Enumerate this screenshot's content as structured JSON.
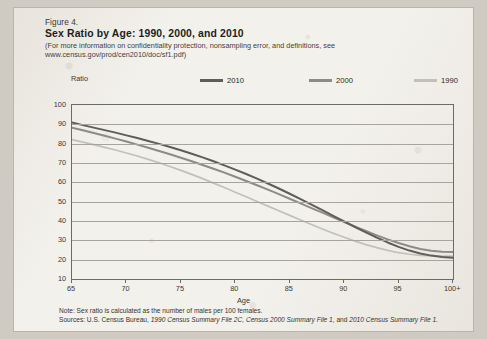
{
  "figure": {
    "number": "Figure 4.",
    "title": "Sex Ratio by Age: 1990, 2000, and 2010",
    "subtitle_line1": "(For more information on confidentiality protection, nonsampling error, and definitions, see",
    "subtitle_line2": "www.census.gov/prod/cen2010/doc/sf1.pdf)"
  },
  "notes": {
    "note": "Note: Sex ratio is calculated as the number of males per 100 females.",
    "sources_prefix": "Sources: U.S. Census Bureau, ",
    "sources_italic1": "1990 Census Summary File 2C, Census 2000 Summary File 1,",
    "sources_mid": " and ",
    "sources_italic2": "2010 Census Summary File 1."
  },
  "colors": {
    "series_2010": "#5f5d5a",
    "series_2000": "#8d8b88",
    "series_1990": "#c2c0bd",
    "axis": "#6d6a64",
    "grid": "#a8a49c",
    "text": "#2e2c28"
  },
  "chart_data": {
    "type": "line",
    "title": "Sex Ratio by Age: 1990, 2000, and 2010",
    "xlabel": "Age",
    "ylabel": "Ratio",
    "xlim": [
      65,
      100
    ],
    "ylim": [
      10,
      100
    ],
    "ytick_labels": [
      "100",
      "90",
      "80",
      "70",
      "60",
      "50",
      "40",
      "30",
      "20",
      "10"
    ],
    "ytick_values": [
      100,
      90,
      80,
      70,
      60,
      50,
      40,
      30,
      20,
      10
    ],
    "xtick_labels": [
      "65",
      "70",
      "75",
      "80",
      "85",
      "90",
      "95",
      "100+"
    ],
    "xtick_values": [
      65,
      70,
      75,
      80,
      85,
      90,
      95,
      100
    ],
    "grid": true,
    "legend_position": "top",
    "x": [
      65,
      66,
      67,
      68,
      69,
      70,
      71,
      72,
      73,
      74,
      75,
      76,
      77,
      78,
      79,
      80,
      81,
      82,
      83,
      84,
      85,
      86,
      87,
      88,
      89,
      90,
      91,
      92,
      93,
      94,
      95,
      96,
      97,
      98,
      99,
      100
    ],
    "series": [
      {
        "name": "2010",
        "color": "#5f5d5a",
        "values": [
          90.9,
          89.6,
          88.3,
          87.0,
          85.7,
          84.3,
          82.9,
          81.4,
          79.9,
          78.3,
          76.6,
          74.8,
          72.9,
          70.9,
          68.8,
          66.6,
          64.3,
          61.9,
          59.4,
          56.8,
          54.1,
          51.3,
          48.5,
          45.6,
          42.7,
          39.8,
          36.9,
          34.1,
          31.4,
          28.9,
          26.6,
          24.7,
          23.2,
          22.1,
          21.4,
          21.0
        ]
      },
      {
        "name": "2000",
        "color": "#8d8b88",
        "values": [
          88.3,
          86.9,
          85.5,
          84.1,
          82.6,
          81.1,
          79.5,
          77.9,
          76.2,
          74.5,
          72.7,
          70.9,
          69.0,
          67.0,
          65.0,
          62.9,
          60.7,
          58.5,
          56.2,
          53.9,
          51.5,
          49.1,
          46.7,
          44.3,
          41.9,
          39.5,
          37.1,
          34.8,
          32.6,
          30.5,
          28.6,
          26.9,
          25.5,
          24.6,
          24.1,
          24.0
        ]
      },
      {
        "name": "1990",
        "color": "#c2c0bd",
        "values": [
          82.1,
          80.8,
          79.5,
          78.1,
          76.7,
          75.2,
          73.6,
          71.9,
          70.1,
          68.2,
          66.2,
          64.1,
          61.9,
          59.6,
          57.3,
          54.9,
          52.5,
          50.1,
          47.7,
          45.3,
          42.9,
          40.5,
          38.2,
          35.9,
          33.7,
          31.6,
          29.6,
          27.8,
          26.2,
          24.8,
          23.6,
          22.8,
          22.2,
          21.9,
          21.8,
          21.8
        ]
      }
    ]
  }
}
